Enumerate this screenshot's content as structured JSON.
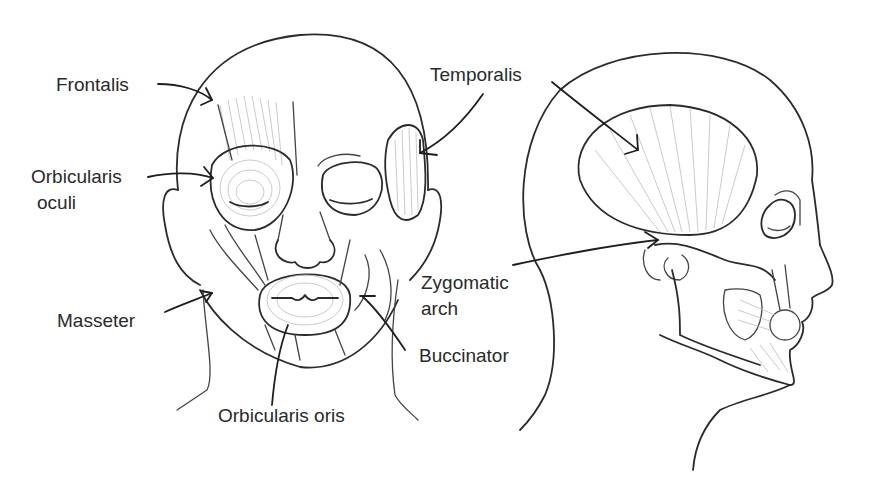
{
  "figure": {
    "views": [
      "front-view",
      "side-view"
    ]
  },
  "labels": {
    "frontalis": "Frontalis",
    "orbicularis_oculi_line1": "Orbicularis",
    "orbicularis_oculi_line2": "oculi",
    "masseter": "Masseter",
    "orbicularis_oris": "Orbicularis oris",
    "temporalis": "Temporalis",
    "zygomatic_line1": "Zygomatic",
    "zygomatic_line2": "arch",
    "buccinator": "Buccinator"
  },
  "colors": {
    "line": "#2b2b2b",
    "text": "#2a2a2a",
    "hatch": "#bdbdbd",
    "background": "#ffffff"
  }
}
